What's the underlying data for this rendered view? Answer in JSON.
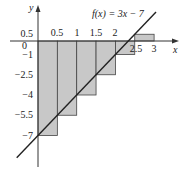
{
  "chart_data": {
    "type": "bar",
    "title": "f(x) = 3x − 7",
    "xlabel": "x",
    "ylabel": "y",
    "x_ticks": [
      "0.5",
      "1",
      "1.5",
      "2",
      "2.5",
      "3"
    ],
    "y_ticks": [
      "0.5",
      "0",
      "−1",
      "−2.5",
      "−4",
      "−5.5",
      "−7"
    ],
    "categories": [
      "[0,0.5]",
      "[0.5,1]",
      "[1,1.5]",
      "[1.5,2]",
      "[2,2.5]",
      "[2.5,3]"
    ],
    "values": [
      -7,
      -5.5,
      -4,
      -2.5,
      -1,
      0.5
    ],
    "line": {
      "slope": 3,
      "intercept": -7,
      "x_range": [
        -0.55,
        3.05
      ]
    },
    "xlim": [
      -0.6,
      3.3
    ],
    "ylim": [
      -8.5,
      2
    ],
    "grid": false,
    "legend": null
  },
  "colors": {
    "bar_fill": "#c8c8c8",
    "bar_stroke": "#444444",
    "line": "#222222",
    "axis": "#333333"
  }
}
